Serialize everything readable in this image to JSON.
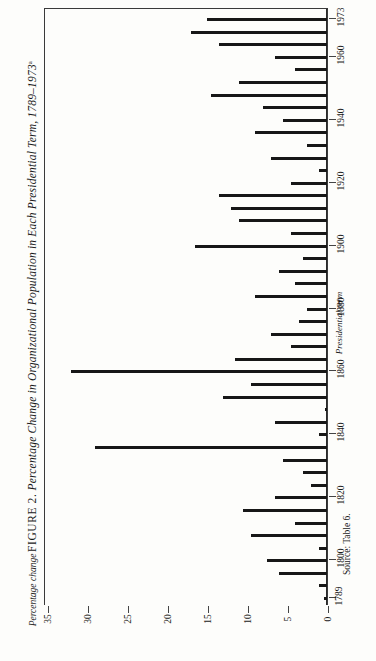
{
  "figure": {
    "number": "FIGURE 2.",
    "caption": "Percentage Change in Organizational Population in Each Presidential Term, 1789–1973",
    "footnote_marker": "a",
    "source": "Source: Table 6."
  },
  "axes": {
    "value_axis_title": "Percentage change",
    "category_axis_title": "Presidential term",
    "value_ticks": [
      "35",
      "30",
      "25",
      "20",
      "15",
      "10",
      "5",
      "0"
    ],
    "year_ticks": [
      "1973",
      "1960",
      "1940",
      "1920",
      "1900",
      "1880",
      "1860",
      "1840",
      "1820",
      "1800",
      "1789"
    ]
  },
  "chart_data": {
    "type": "bar",
    "orientation": "horizontal",
    "title": "Percentage Change in Organizational Population in Each Presidential Term, 1789–1973",
    "xlabel": "Percentage change",
    "ylabel": "Presidential term",
    "xlim": [
      0,
      35
    ],
    "ylim_years": [
      1789,
      1973
    ],
    "grid": false,
    "legend": "none",
    "axis_direction": "value axis increases right-to-left; zero baseline at right edge",
    "categories": [
      "1789",
      "1793",
      "1797",
      "1801",
      "1805",
      "1809",
      "1813",
      "1817",
      "1821",
      "1825",
      "1829",
      "1833",
      "1837",
      "1841",
      "1845",
      "1849",
      "1853",
      "1857",
      "1861",
      "1865",
      "1869",
      "1873",
      "1877",
      "1881",
      "1885",
      "1889",
      "1893",
      "1897",
      "1901",
      "1905",
      "1909",
      "1913",
      "1917",
      "1921",
      "1925",
      "1929",
      "1933",
      "1937",
      "1941",
      "1945",
      "1949",
      "1953",
      "1957",
      "1961",
      "1965",
      "1969",
      "1973"
    ],
    "values": [
      0.4,
      1.0,
      6.0,
      7.5,
      1.0,
      9.5,
      4.0,
      10.5,
      6.5,
      2.0,
      3.0,
      5.5,
      29.0,
      1.0,
      6.5,
      0.3,
      13.0,
      9.5,
      32.0,
      11.5,
      4.5,
      7.0,
      3.5,
      2.5,
      9.0,
      4.0,
      6.0,
      3.0,
      16.5,
      4.5,
      11.0,
      12.0,
      13.5,
      4.5,
      1.0,
      7.0,
      2.5,
      9.0,
      5.5,
      8.0,
      14.5,
      11.0,
      4.0,
      6.5,
      13.5,
      17.0,
      15.0
    ]
  }
}
